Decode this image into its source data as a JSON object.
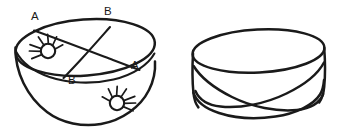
{
  "figure": {
    "kind": "line-drawing",
    "background_color": "#ffffff",
    "ink_color": "#1a1a1a",
    "canvas": {
      "width": 340,
      "height": 137
    },
    "panels": [
      {
        "id": "bowl-panel",
        "name": "hemispherical-bowl-with-crossing-chords",
        "description": "Bowl seen in perspective; elliptical rim with two chords crossing, each chord end labelled, and two radiating spider figures on the inner surface.",
        "labels": [
          {
            "id": "label-a-top-left",
            "text": "A",
            "x": 31,
            "y": 20
          },
          {
            "id": "label-b-top-right",
            "text": "B",
            "x": 104,
            "y": 15
          },
          {
            "id": "label-a-right",
            "text": "A",
            "x": 131,
            "y": 69
          },
          {
            "id": "label-b-bottom-left",
            "text": "B",
            "x": 68,
            "y": 84
          }
        ],
        "spiders": [
          {
            "id": "spider-upper-left",
            "name": "spider-figure",
            "body_cx": 48,
            "body_cy": 51,
            "body_r": 7.2,
            "legs": 7
          },
          {
            "id": "spider-lower-right",
            "name": "spider-figure",
            "body_cx": 117,
            "body_cy": 103,
            "body_r": 7.2,
            "legs": 7
          }
        ]
      },
      {
        "id": "band-panel",
        "name": "twisted-band-loop",
        "description": "Open cylindrical band drawn in perspective whose lower edge twists and crosses itself near the bottom centre, suggesting a Moebius-like strip.",
        "labels": [],
        "spiders": []
      }
    ]
  }
}
